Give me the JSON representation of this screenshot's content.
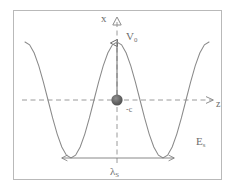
{
  "figure": {
    "title_semantic": "standing-wave-optical-potential",
    "frame": {
      "x": 13,
      "y": 10,
      "width": 209,
      "height": 170,
      "border_color": "#b9b9b9"
    },
    "background_color": "#ffffff",
    "stroke_color": "#6d6d6d",
    "curve_color": "#8a8a8a",
    "dot_color": "#5a5a5a",
    "dashed_axis_color": "#9a9a9a"
  },
  "labels": {
    "vertical_axis": "x",
    "potential_amplitude": "V",
    "potential_amplitude_subscript": "0",
    "horizontal_axis": "z",
    "center_point": "-c",
    "field_label": "E",
    "field_label_subscript": "s",
    "wavelength_label": "λ",
    "wavelength_label_subscript": "S"
  },
  "chart_data": {
    "type": "line",
    "title": "",
    "xlabel": "z",
    "ylabel": "x",
    "grid": false,
    "legend_position": "none",
    "function": "V0*cos(2*pi*z/lambda_S)",
    "period_label": "λ_S",
    "amplitude_label": "V_0",
    "xlim": [
      -1.0,
      1.0
    ],
    "ylim": [
      -1.15,
      1.15
    ],
    "x": [
      -1.0,
      -0.95,
      -0.9,
      -0.85,
      -0.8,
      -0.75,
      -0.7,
      -0.65,
      -0.6,
      -0.55,
      -0.5,
      -0.45,
      -0.4,
      -0.35,
      -0.3,
      -0.25,
      -0.2,
      -0.15,
      -0.1,
      -0.05,
      0.0,
      0.05,
      0.1,
      0.15,
      0.2,
      0.25,
      0.3,
      0.35,
      0.4,
      0.45,
      0.5,
      0.55,
      0.6,
      0.65,
      0.7,
      0.75,
      0.8,
      0.85,
      0.9,
      0.95,
      1.0
    ],
    "values": [
      1.0,
      0.951,
      0.809,
      0.588,
      0.309,
      0.0,
      -0.309,
      -0.588,
      -0.809,
      -0.951,
      -1.0,
      -0.951,
      -0.809,
      -0.588,
      -0.309,
      0.0,
      0.309,
      0.588,
      0.809,
      0.951,
      1.0,
      0.951,
      0.809,
      0.588,
      0.309,
      0.0,
      -0.309,
      -0.588,
      -0.809,
      -0.951,
      -1.0,
      -0.951,
      -0.809,
      -0.588,
      -0.309,
      0.0,
      0.309,
      0.588,
      0.809,
      0.951,
      1.0
    ],
    "annotations": [
      {
        "name": "origin-dot",
        "x": 0.0,
        "y": 0.0,
        "label": "-c"
      },
      {
        "name": "wavelength-span-arrow",
        "x_start": -0.5,
        "x_end": 0.5,
        "label": "λ_S"
      },
      {
        "name": "amplitude-arrow",
        "x": 0.0,
        "y_start": 0.0,
        "y_end": 1.0,
        "label": "V_0"
      },
      {
        "name": "field-label",
        "label": "E_s"
      }
    ]
  }
}
